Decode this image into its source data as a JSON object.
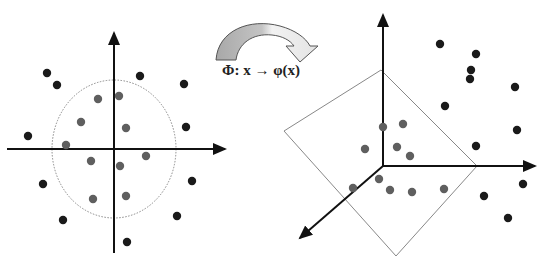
{
  "mapping_label": "Φ:  x → φ(x)",
  "colors": {
    "axis": "#111111",
    "outer_point": "#1a1a1a",
    "inner_point": "#5f5f5f",
    "boundary": "#888888",
    "arrow_fill_left": "#b0b0b0",
    "arrow_fill_right": "#ececec"
  },
  "input_space": {
    "axes": {
      "origin": [
        114,
        149
      ],
      "x_end": [
        225,
        149
      ],
      "x_start": [
        7,
        149
      ],
      "y_top": [
        114,
        33
      ],
      "y_bottom": [
        114,
        253
      ]
    },
    "boundary_circle": {
      "cx": 114,
      "cy": 149,
      "rx": 62,
      "ry": 69
    },
    "outer_points": [
      [
        47,
        73
      ],
      [
        57,
        85
      ],
      [
        140,
        76
      ],
      [
        184,
        84
      ],
      [
        28,
        136
      ],
      [
        186,
        127
      ],
      [
        43,
        184
      ],
      [
        63,
        220
      ],
      [
        192,
        181
      ],
      [
        177,
        216
      ],
      [
        127,
        242
      ]
    ],
    "inner_points": [
      [
        98,
        99
      ],
      [
        119,
        96
      ],
      [
        81,
        122
      ],
      [
        126,
        128
      ],
      [
        66,
        145
      ],
      [
        91,
        161
      ],
      [
        120,
        166
      ],
      [
        146,
        156
      ],
      [
        93,
        199
      ],
      [
        126,
        196
      ]
    ]
  },
  "feature_space": {
    "axes": {
      "origin": [
        383,
        166
      ],
      "up": [
        383,
        15
      ],
      "right": [
        535,
        166
      ],
      "diag": [
        300,
        238
      ]
    },
    "separating_plane": [
      [
        381,
        70
      ],
      [
        284,
        131
      ],
      [
        396,
        256
      ],
      [
        477,
        166
      ]
    ],
    "outer_points": [
      [
        440,
        44
      ],
      [
        476,
        54
      ],
      [
        471,
        70
      ],
      [
        470,
        79
      ],
      [
        515,
        87
      ],
      [
        445,
        106
      ],
      [
        517,
        130
      ],
      [
        476,
        146
      ],
      [
        523,
        184
      ],
      [
        484,
        196
      ],
      [
        508,
        218
      ]
    ],
    "inner_points": [
      [
        383,
        127
      ],
      [
        403,
        124
      ],
      [
        365,
        149
      ],
      [
        397,
        147
      ],
      [
        410,
        156
      ],
      [
        379,
        179
      ],
      [
        390,
        190
      ],
      [
        412,
        192
      ],
      [
        444,
        189
      ],
      [
        353,
        188
      ]
    ]
  }
}
